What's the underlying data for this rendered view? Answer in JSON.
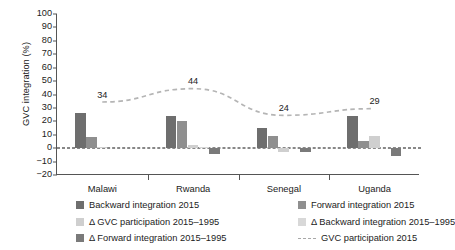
{
  "chart_data": {
    "type": "bar",
    "title": "",
    "xlabel": "",
    "ylabel": "GVC integration (%)",
    "ylim": [
      -20,
      100
    ],
    "ytick_step": 10,
    "yticks": [
      100,
      90,
      80,
      70,
      60,
      50,
      40,
      30,
      20,
      10,
      0,
      -10,
      -20
    ],
    "categories": [
      "Malawi",
      "Rwanda",
      "Senegal",
      "Uganda"
    ],
    "grid": false,
    "legend_position": "bottom",
    "zero_line": true,
    "series": [
      {
        "name": "Backward integration 2015",
        "kind": "bar",
        "color": "#6e6e6e",
        "values": [
          26,
          24,
          15,
          24
        ]
      },
      {
        "name": "Forward integration 2015",
        "kind": "bar",
        "color": "#8f8f8f",
        "values": [
          8,
          20,
          9,
          5
        ]
      },
      {
        "name": "Δ GVC participation 2015–1995",
        "kind": "bar",
        "color": "#cfcfcf",
        "values": [
          1,
          2,
          -3,
          9
        ]
      },
      {
        "name": "Δ Backward integration 2015–1995",
        "kind": "bar",
        "color": "#d8d8d8",
        "values": [
          0,
          1,
          0,
          0
        ]
      },
      {
        "name": "Δ Forward integration 2015–1995",
        "kind": "bar",
        "color": "#7a7a7a",
        "values": [
          0,
          -4,
          -3,
          -6
        ]
      },
      {
        "name": "GVC participation 2015",
        "kind": "line",
        "color": "#b5b5b5",
        "style": "dashed",
        "values": [
          34,
          44,
          24,
          29
        ],
        "labels": [
          "34",
          "44",
          "24",
          "29"
        ]
      }
    ]
  },
  "legend": {
    "items": [
      {
        "label": "Backward integration 2015",
        "swatch": "#6e6e6e",
        "type": "box"
      },
      {
        "label": "Forward integration 2015",
        "swatch": "#8f8f8f",
        "type": "box"
      },
      {
        "label": "Δ GVC participation 2015–1995",
        "swatch": "#cfcfcf",
        "type": "box"
      },
      {
        "label": "Δ Backward integration 2015–1995",
        "swatch": "#d8d8d8",
        "type": "box"
      },
      {
        "label": "Δ Forward integration 2015–1995",
        "swatch": "#7a7a7a",
        "type": "box"
      },
      {
        "label": "GVC participation 2015",
        "swatch": "#a8a8a8",
        "type": "line"
      }
    ]
  }
}
